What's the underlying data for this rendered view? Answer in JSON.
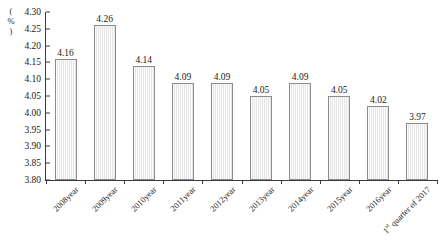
{
  "chart_data": {
    "type": "bar",
    "title": "",
    "xlabel": "",
    "ylabel": "(%)",
    "ylim": [
      3.8,
      4.3
    ],
    "ytick_step": 0.05,
    "yticks": [
      "4.30",
      "4.25",
      "4.20",
      "4.15",
      "4.10",
      "4.05",
      "4.00",
      "3.95",
      "3.90",
      "3.85",
      "3.80"
    ],
    "grid": false,
    "legend": false,
    "categories": [
      "2008year",
      "2009year",
      "2010year",
      "2011year",
      "2012year",
      "2013year",
      "2014year",
      "2015year",
      "2016year",
      "1st quarter of 2017"
    ],
    "category_html": [
      "2008year",
      "2009year",
      "2010year",
      "2011year",
      "2012year",
      "2013year",
      "2014year",
      "2015year",
      "2016year",
      "1<sup>st</sup> quarter of 2017"
    ],
    "values": [
      4.16,
      4.26,
      4.14,
      4.09,
      4.09,
      4.05,
      4.09,
      4.05,
      4.02,
      3.97
    ],
    "value_labels": [
      "4.16",
      "4.26",
      "4.14",
      "4.09",
      "4.09",
      "4.05",
      "4.09",
      "4.05",
      "4.02",
      "3.97"
    ],
    "colors": {
      "bar_fill": "#e6e6e6",
      "bar_border": "#8c8c8c",
      "axis": "#3a3a3a",
      "text": "#1a1a1a",
      "background": "#ffffff"
    }
  }
}
